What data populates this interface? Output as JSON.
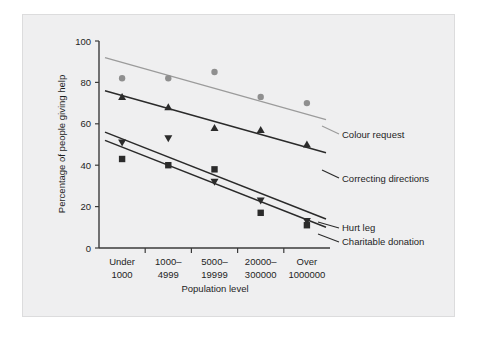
{
  "figure": {
    "background_color": "#efeff0",
    "page_color": "#ffffff",
    "border_color": "#dcdcdd"
  },
  "chart_data": {
    "type": "scatter",
    "title": "",
    "xlabel": "Population level",
    "ylabel": "Percentage of people giving help",
    "categories": [
      "Under 1000",
      "1000–4999",
      "5000–19999",
      "20000–300000",
      "Over 1000000"
    ],
    "category_lines": [
      [
        "Under",
        "1000"
      ],
      [
        "1000–",
        "4999"
      ],
      [
        "5000–",
        "19999"
      ],
      [
        "20000–",
        "300000"
      ],
      [
        "Over",
        "1000000"
      ]
    ],
    "ylim": [
      0,
      100
    ],
    "yticks": [
      0,
      20,
      40,
      60,
      80,
      100
    ],
    "grid": false,
    "legend_position": "right-inline-labels",
    "series": [
      {
        "name": "Colour request",
        "marker": "circle",
        "color": "#8f8f8f",
        "line_color": "#9b9b9b",
        "values": [
          82,
          82,
          85,
          73,
          70
        ],
        "fit_start": 92,
        "fit_end": 62
      },
      {
        "name": "Correcting directions",
        "marker": "triangle-up",
        "color": "#2b2b2b",
        "line_color": "#2a2a2a",
        "values": [
          73,
          68,
          58,
          57,
          50
        ],
        "fit_start": 76,
        "fit_end": 46
      },
      {
        "name": "Hurt leg",
        "marker": "triangle-down",
        "color": "#2b2b2b",
        "line_color": "#2a2a2a",
        "values": [
          51,
          53,
          32,
          23,
          13
        ],
        "fit_start": 56,
        "fit_end": 14
      },
      {
        "name": "Charitable donation",
        "marker": "square",
        "color": "#2b2b2b",
        "line_color": "#2a2a2a",
        "values": [
          43,
          40,
          38,
          17,
          11
        ],
        "fit_start": 52,
        "fit_end": 10
      }
    ]
  },
  "axes": {
    "y_tick_labels": [
      "0",
      "20",
      "40",
      "60",
      "80",
      "100"
    ],
    "y_axis_title": "Percentage of people giving help",
    "x_axis_title": "Population level"
  },
  "legend": {
    "items": [
      {
        "label": "Colour request"
      },
      {
        "label": "Correcting directions"
      },
      {
        "label": "Hurt leg"
      },
      {
        "label": "Charitable donation"
      }
    ]
  }
}
